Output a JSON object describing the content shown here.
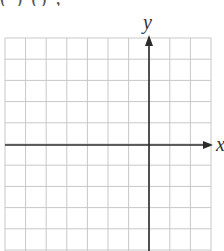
{
  "header": {
    "clipped_text": "(        )      ()      ,"
  },
  "diagram": {
    "type": "coordinate-plane-grid",
    "x_axis_label": "x",
    "y_axis_label": "y",
    "grid": {
      "columns": 10,
      "rows_visible": 10,
      "left_px": 5,
      "right_px": 211,
      "top_px": 38,
      "bottom_px": 251,
      "col_spacing_px": 20.6,
      "row_spacing_px": 21.2,
      "y_axis_x_px": 149,
      "x_axis_y_px": 145
    },
    "colors": {
      "grid_line": "#c8c8c8",
      "axis": "#2b2b2b",
      "label": "#333333",
      "background": "#ffffff"
    }
  }
}
